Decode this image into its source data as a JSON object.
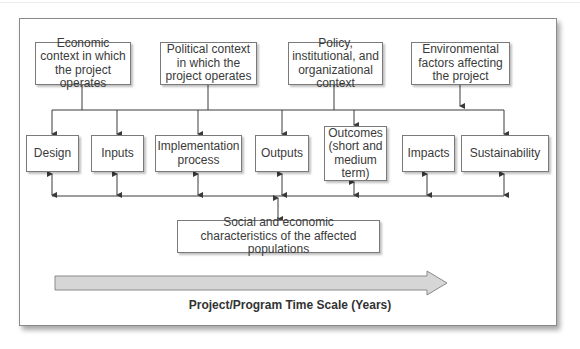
{
  "diagram": {
    "context_factors": [
      {
        "label": "Economic context in which the project operates"
      },
      {
        "label": "Political context in which the project operates"
      },
      {
        "label": "Policy, institutional, and organizational context"
      },
      {
        "label": "Environmental factors affecting the project"
      }
    ],
    "stages": [
      {
        "label": "Design"
      },
      {
        "label": "Inputs"
      },
      {
        "label": "Implementation process"
      },
      {
        "label": "Outputs"
      },
      {
        "label": "Outcomes (short and medium term)"
      },
      {
        "label": "Impacts"
      },
      {
        "label": "Sustainability"
      }
    ],
    "population": {
      "label": "Social and economic characteristics of the affected populations"
    },
    "timescale": {
      "label": "Project/Program Time Scale (Years)"
    }
  },
  "colors": {
    "line": "#3a3a3a",
    "box_border": "#7a7a7a",
    "arrow_fill": "#d6d6d6",
    "arrow_stroke": "#8a8a8a"
  }
}
